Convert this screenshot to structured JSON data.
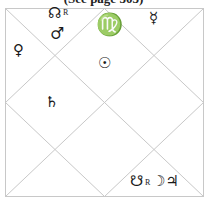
{
  "caption": "(See page 303)",
  "chart": {
    "style": "North Indian square horoscope",
    "frame": {
      "x1": 5,
      "y1": 8,
      "x2": 204,
      "y2": 197
    },
    "line_color": "#c8c8c8",
    "houses": [
      {
        "position": "top-left-upper",
        "symbols": [
          "☊",
          "R",
          "♂"
        ],
        "labels": [
          "North Node (Rahu) retrograde",
          "Mars"
        ]
      },
      {
        "position": "top-center",
        "sign_symbol": "♍",
        "sign": "Virgo",
        "symbols": [
          "☉"
        ],
        "labels": [
          "Sun"
        ]
      },
      {
        "position": "top-right",
        "symbols": [
          "☿"
        ],
        "labels": [
          "Mercury"
        ]
      },
      {
        "position": "left-upper",
        "symbols": [
          "♀"
        ],
        "labels": [
          "Venus"
        ]
      },
      {
        "position": "left-center",
        "symbols": [
          "♄"
        ],
        "labels": [
          "Saturn"
        ]
      },
      {
        "position": "bottom-right",
        "symbols": [
          "☋",
          "R",
          "☽",
          "♃"
        ],
        "labels": [
          "South Node (Ketu) retrograde",
          "Moon",
          "Jupiter"
        ]
      }
    ]
  },
  "glyphs": {
    "north_node": "☊",
    "north_node_retro": "R",
    "mars": "♂",
    "virgo": "♍",
    "mercury": "☿",
    "venus": "♀",
    "sun": "☉",
    "saturn": "♄",
    "south_node": "☋",
    "south_node_retro": "R",
    "moon": "☽",
    "jupiter": "♃"
  }
}
